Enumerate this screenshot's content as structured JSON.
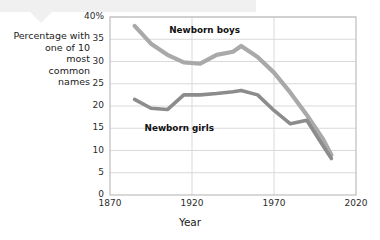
{
  "figure": {
    "caption_lines": "Percentage with\none of 10\nmost\ncommon\nnames",
    "x_axis_title": "Year",
    "colors": {
      "boys_line": "#a9a9a9",
      "girls_line": "#8c8c8c",
      "grid": "#d9d9d9",
      "frame": "#bfbfbf",
      "background": "#ffffff",
      "callout_band": "#f0f0f0"
    }
  },
  "chart_data": {
    "type": "line",
    "title": "",
    "xlabel": "Year",
    "ylabel": "Percentage with one of 10 most common names",
    "xlim": [
      1870,
      2020
    ],
    "ylim": [
      0,
      40
    ],
    "xticks": [
      1870,
      1920,
      1970,
      2020
    ],
    "xticklabels": [
      "1870",
      "1920",
      "1970",
      "2020"
    ],
    "yticks": [
      0,
      5,
      10,
      15,
      20,
      25,
      30,
      35,
      40
    ],
    "yticklabels": [
      "0",
      "5",
      "10",
      "15",
      "20",
      "25",
      "30",
      "35",
      "40%"
    ],
    "grid": "horizontal gridlines every 5 percent; vertical gridlines at 1920 and 1970",
    "legend": "inline labels next to each line",
    "annotations": [
      {
        "text": "Newborn boys",
        "x": 1900,
        "y": 37
      },
      {
        "text": "Newborn girls",
        "x": 1885,
        "y": 15
      }
    ],
    "series": [
      {
        "name": "Newborn boys",
        "x": [
          1885,
          1895,
          1905,
          1915,
          1925,
          1935,
          1945,
          1950,
          1960,
          1970,
          1980,
          1990,
          2000,
          2005
        ],
        "values": [
          38.0,
          34.0,
          31.5,
          29.8,
          29.5,
          31.5,
          32.2,
          33.5,
          31.0,
          27.5,
          23.0,
          18.0,
          12.5,
          9.0
        ]
      },
      {
        "name": "Newborn girls",
        "x": [
          1885,
          1895,
          1905,
          1915,
          1925,
          1935,
          1945,
          1950,
          1960,
          1970,
          1980,
          1990,
          2000,
          2005
        ],
        "values": [
          21.5,
          19.5,
          19.2,
          22.5,
          22.5,
          22.8,
          23.2,
          23.5,
          22.5,
          19.0,
          16.0,
          16.8,
          11.0,
          8.2
        ]
      }
    ]
  }
}
